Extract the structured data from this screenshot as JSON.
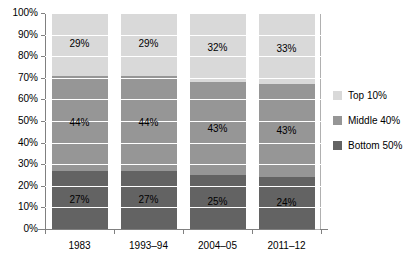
{
  "chart_data": {
    "type": "bar",
    "subtype": "stacked-100-percent",
    "title": "",
    "xlabel": "",
    "ylabel": "",
    "ylim": [
      0,
      100
    ],
    "yticks": [
      "0%",
      "10%",
      "20%",
      "30%",
      "40%",
      "50%",
      "60%",
      "70%",
      "80%",
      "90%",
      "100%"
    ],
    "grid": true,
    "legend_position": "right",
    "categories": [
      "1983",
      "1993–94",
      "2004–05",
      "2011–12"
    ],
    "series": [
      {
        "name": "Bottom 50%",
        "color": "#636363",
        "values": [
          27,
          27,
          25,
          24
        ],
        "labels": [
          "27%",
          "27%",
          "25%",
          "24%"
        ]
      },
      {
        "name": "Middle 40%",
        "color": "#969696",
        "values": [
          44,
          44,
          43,
          43
        ],
        "labels": [
          "44%",
          "44%",
          "43%",
          "43%"
        ]
      },
      {
        "name": "Top 10%",
        "color": "#d9d9d9",
        "values": [
          29,
          29,
          32,
          33
        ],
        "labels": [
          "29%",
          "29%",
          "32%",
          "33%"
        ]
      }
    ],
    "legend": [
      {
        "label": "Top 10%",
        "color": "#d9d9d9"
      },
      {
        "label": "Middle 40%",
        "color": "#969696"
      },
      {
        "label": "Bottom 50%",
        "color": "#636363"
      }
    ]
  }
}
